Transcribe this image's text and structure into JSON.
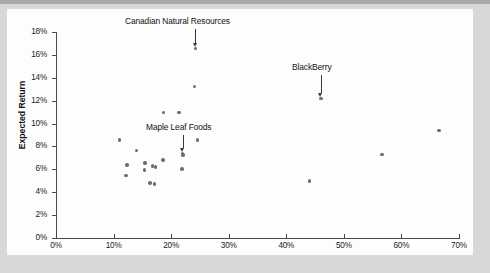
{
  "chart_data": {
    "type": "scatter",
    "title": "",
    "xlabel": "",
    "ylabel": "Expected Return",
    "xlim": [
      0,
      70
    ],
    "ylim": [
      0,
      18
    ],
    "grid": false,
    "legend": "none",
    "x_unit": "%",
    "y_unit": "%",
    "xticks": [
      "0%",
      "10%",
      "20%",
      "30%",
      "40%",
      "50%",
      "60%",
      "70%"
    ],
    "xtick_values": [
      0,
      10,
      20,
      30,
      40,
      50,
      60,
      70
    ],
    "yticks": [
      "0%",
      "2%",
      "4%",
      "6%",
      "8%",
      "10%",
      "12%",
      "14%",
      "16%",
      "18%"
    ],
    "ytick_values": [
      0,
      2,
      4,
      6,
      8,
      10,
      12,
      14,
      16,
      18
    ],
    "points": [
      {
        "x": 11.0,
        "y": 8.55,
        "label": ""
      },
      {
        "x": 12.3,
        "y": 6.4,
        "label": ""
      },
      {
        "x": 12.2,
        "y": 5.45,
        "label": ""
      },
      {
        "x": 14.0,
        "y": 7.65,
        "label": ""
      },
      {
        "x": 15.5,
        "y": 6.55,
        "label": ""
      },
      {
        "x": 15.4,
        "y": 5.95,
        "label": ""
      },
      {
        "x": 16.3,
        "y": 4.8,
        "label": ""
      },
      {
        "x": 17.1,
        "y": 4.7,
        "label": ""
      },
      {
        "x": 16.8,
        "y": 6.28,
        "label": ""
      },
      {
        "x": 17.3,
        "y": 6.22,
        "label": ""
      },
      {
        "x": 18.6,
        "y": 6.8,
        "label": ""
      },
      {
        "x": 18.7,
        "y": 10.95,
        "label": ""
      },
      {
        "x": 21.4,
        "y": 10.95,
        "label": ""
      },
      {
        "x": 22.0,
        "y": 7.4,
        "label": "Maple Leaf Foods"
      },
      {
        "x": 22.1,
        "y": 7.25,
        "label": ""
      },
      {
        "x": 21.9,
        "y": 6.05,
        "label": ""
      },
      {
        "x": 24.1,
        "y": 13.25,
        "label": ""
      },
      {
        "x": 24.2,
        "y": 16.58,
        "label": "Canadian Natural Resources"
      },
      {
        "x": 24.6,
        "y": 8.55,
        "label": ""
      },
      {
        "x": 44.0,
        "y": 5.0,
        "label": ""
      },
      {
        "x": 46.0,
        "y": 12.2,
        "label": "BlackBerry"
      },
      {
        "x": 56.6,
        "y": 7.3,
        "label": ""
      },
      {
        "x": 66.5,
        "y": 9.4,
        "label": ""
      }
    ],
    "annotations": [
      {
        "text": "Canadian  Natural Resources",
        "target_x": 24.2,
        "target_y": 16.58,
        "label_x": 125,
        "label_y": 16
      },
      {
        "text": "BlackBerry",
        "target_x": 46.0,
        "target_y": 12.2,
        "label_x": 292,
        "label_y": 62
      },
      {
        "text": "Maple Leaf Foods",
        "target_x": 22.0,
        "target_y": 7.4,
        "label_x": 146,
        "label_y": 122
      }
    ],
    "marker_color": "#6e6e6e",
    "axis_color": "#4a4a4a"
  },
  "colors": {
    "page_background": "#d8d8d8",
    "paper": "#fdfdfd",
    "marker": "#6e6e6e",
    "axis": "#4a4a4a",
    "text": "#121212"
  }
}
